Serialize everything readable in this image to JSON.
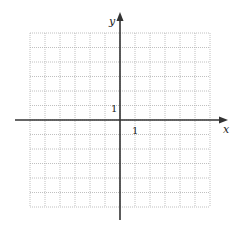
{
  "chart_data": {
    "type": "scatter",
    "title": "",
    "xlabel": "x",
    "ylabel": "y",
    "xlim": [
      -6,
      6
    ],
    "ylim": [
      -6,
      6
    ],
    "grid": true,
    "grid_style": "dotted",
    "tick_labels": [
      {
        "axis": "x",
        "value": 1,
        "label": "1"
      },
      {
        "axis": "y",
        "value": 1,
        "label": "1"
      }
    ],
    "series": []
  },
  "axes": {
    "x_label": "x",
    "y_label": "y",
    "x_tick": "1",
    "y_tick": "1"
  },
  "colors": {
    "grid": "#b0b0b0",
    "axis": "#333333",
    "background": "#ffffff"
  }
}
